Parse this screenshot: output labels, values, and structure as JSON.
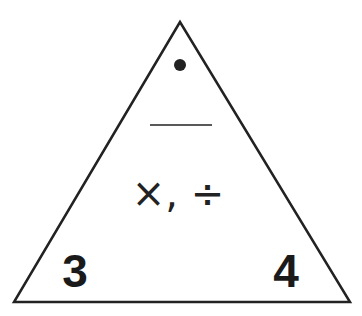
{
  "diagram": {
    "type": "fact-family-triangle",
    "top_value": "•",
    "top_value_meaning": "missing-value-dot",
    "operations": "×, ÷",
    "bottom_left": "3",
    "bottom_right": "4"
  },
  "colors": {
    "stroke": "#222222",
    "background": "#ffffff"
  }
}
